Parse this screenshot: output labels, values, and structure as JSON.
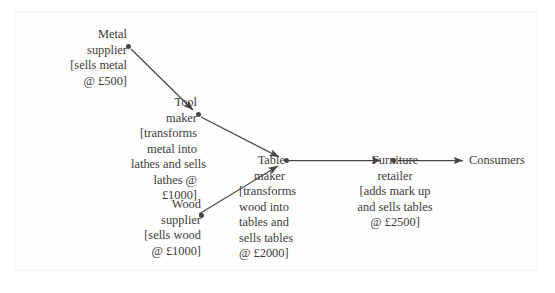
{
  "diagram": {
    "background_color": "#ffffff",
    "text_color": "#3d3a39",
    "line_color": "#4a4746",
    "nodes": [
      {
        "id": "metal-supplier",
        "lines": [
          "Metal",
          "supplier",
          "[sells metal",
          "@ £500]"
        ],
        "price": "£500"
      },
      {
        "id": "tool-maker",
        "lines": [
          "Tool",
          "maker",
          "[transforms",
          "metal into",
          "lathes and sells",
          "lathes @",
          "£1000]"
        ],
        "price": "£1000"
      },
      {
        "id": "wood-supplier",
        "lines": [
          "Wood",
          "supplier",
          "[sells wood",
          "@ £1000]"
        ],
        "price": "£1000"
      },
      {
        "id": "table-maker",
        "lines": [
          "Table",
          "maker",
          "[transforms",
          "wood into",
          "tables and",
          "sells tables",
          "@ £2000]"
        ],
        "price": "£2000"
      },
      {
        "id": "furniture-retailer",
        "lines": [
          "Furniture",
          "retailer",
          "[adds mark up",
          "and sells tables",
          "@ £2500]"
        ],
        "price": "£2500"
      },
      {
        "id": "consumers",
        "lines": [
          "Consumers"
        ],
        "price": ""
      }
    ],
    "edges": [
      {
        "from": "metal-supplier",
        "to": "tool-maker"
      },
      {
        "from": "tool-maker",
        "to": "table-maker"
      },
      {
        "from": "wood-supplier",
        "to": "table-maker"
      },
      {
        "from": "table-maker",
        "to": "furniture-retailer"
      },
      {
        "from": "furniture-retailer",
        "to": "consumers"
      }
    ]
  }
}
